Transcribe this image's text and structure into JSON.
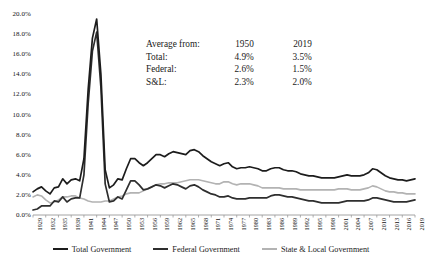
{
  "chart_data": {
    "type": "line",
    "title": "",
    "xlabel": "",
    "ylabel": "",
    "ylim": [
      0,
      20
    ],
    "ytick_labels": [
      "20.0%",
      "18.0%",
      "16.0%",
      "14.0%",
      "12.0%",
      "10.0%",
      "8.0%",
      "6.0%",
      "4.0%",
      "2.0%",
      "0.0%"
    ],
    "ytick_values": [
      20,
      18,
      16,
      14,
      12,
      10,
      8,
      6,
      4,
      2,
      0
    ],
    "grid": false,
    "legend_position": "bottom",
    "xlim": [
      1929,
      2019
    ],
    "xtick_labels": [
      "1929",
      "1932",
      "1935",
      "1938",
      "1941",
      "1944",
      "1947",
      "1950",
      "1953",
      "1956",
      "1959",
      "1962",
      "1965",
      "1968",
      "1971",
      "1974",
      "1977",
      "1980",
      "1983",
      "1986",
      "1989",
      "1992",
      "1995",
      "1998",
      "2001",
      "2004",
      "2007",
      "2010",
      "2013",
      "2016",
      "2019"
    ],
    "x": [
      1929,
      1930,
      1931,
      1932,
      1933,
      1934,
      1935,
      1936,
      1937,
      1938,
      1939,
      1940,
      1941,
      1942,
      1943,
      1944,
      1945,
      1946,
      1947,
      1948,
      1949,
      1950,
      1951,
      1952,
      1953,
      1954,
      1955,
      1956,
      1957,
      1958,
      1959,
      1960,
      1961,
      1962,
      1963,
      1964,
      1965,
      1966,
      1967,
      1968,
      1969,
      1970,
      1971,
      1972,
      1973,
      1974,
      1975,
      1976,
      1977,
      1978,
      1979,
      1980,
      1981,
      1982,
      1983,
      1984,
      1985,
      1986,
      1987,
      1988,
      1989,
      1990,
      1991,
      1992,
      1993,
      1994,
      1995,
      1996,
      1997,
      1998,
      1999,
      2000,
      2001,
      2002,
      2003,
      2004,
      2005,
      2006,
      2007,
      2008,
      2009,
      2010,
      2011,
      2012,
      2013,
      2014,
      2015,
      2016,
      2017,
      2018,
      2019
    ],
    "series": [
      {
        "name": "Total Government",
        "color": "#1c1c1c",
        "values": [
          2.3,
          2.6,
          2.8,
          2.4,
          2.1,
          2.7,
          2.8,
          3.6,
          3.1,
          3.5,
          3.6,
          3.4,
          5.6,
          12.5,
          17.6,
          19.5,
          14.0,
          4.5,
          2.7,
          3.0,
          3.6,
          3.5,
          4.6,
          5.6,
          5.6,
          5.2,
          4.9,
          5.2,
          5.6,
          6.0,
          6.0,
          5.8,
          6.1,
          6.3,
          6.2,
          6.1,
          6.0,
          6.4,
          6.5,
          6.3,
          5.9,
          5.6,
          5.3,
          5.1,
          4.9,
          5.1,
          5.2,
          4.8,
          4.6,
          4.7,
          4.7,
          4.8,
          4.7,
          4.6,
          4.4,
          4.4,
          4.6,
          4.7,
          4.7,
          4.5,
          4.4,
          4.4,
          4.3,
          4.1,
          4.0,
          3.9,
          3.9,
          3.8,
          3.7,
          3.7,
          3.7,
          3.7,
          3.8,
          3.9,
          4.0,
          3.9,
          3.9,
          3.9,
          4.0,
          4.2,
          4.6,
          4.5,
          4.2,
          3.9,
          3.7,
          3.6,
          3.5,
          3.5,
          3.4,
          3.5,
          3.6
        ]
      },
      {
        "name": "Federal Government",
        "color": "#2e2e2e",
        "values": [
          0.5,
          0.6,
          0.9,
          0.9,
          0.9,
          1.4,
          1.3,
          1.8,
          1.3,
          1.6,
          1.7,
          1.7,
          4.0,
          11.1,
          16.3,
          18.2,
          12.7,
          3.1,
          1.3,
          1.4,
          1.8,
          1.6,
          2.5,
          3.4,
          3.4,
          3.0,
          2.5,
          2.6,
          2.8,
          3.0,
          2.9,
          2.7,
          2.9,
          3.1,
          3.0,
          2.8,
          2.6,
          2.9,
          3.0,
          2.8,
          2.5,
          2.3,
          2.1,
          2.0,
          1.8,
          1.8,
          1.9,
          1.7,
          1.6,
          1.6,
          1.6,
          1.7,
          1.7,
          1.7,
          1.7,
          1.7,
          1.9,
          2.0,
          2.0,
          1.9,
          1.8,
          1.8,
          1.7,
          1.6,
          1.5,
          1.4,
          1.4,
          1.3,
          1.2,
          1.2,
          1.2,
          1.2,
          1.2,
          1.3,
          1.4,
          1.4,
          1.4,
          1.4,
          1.4,
          1.5,
          1.7,
          1.7,
          1.6,
          1.5,
          1.4,
          1.3,
          1.3,
          1.3,
          1.3,
          1.4,
          1.5
        ]
      },
      {
        "name": "State & Local Government",
        "color": "#b3b3b3",
        "values": [
          1.8,
          2.0,
          1.9,
          1.5,
          1.2,
          1.3,
          1.5,
          1.8,
          1.8,
          1.9,
          1.9,
          1.7,
          1.6,
          1.4,
          1.3,
          1.3,
          1.3,
          1.4,
          1.4,
          1.6,
          1.8,
          1.9,
          2.1,
          2.2,
          2.2,
          2.2,
          2.4,
          2.6,
          2.8,
          3.0,
          3.1,
          3.1,
          3.2,
          3.2,
          3.2,
          3.3,
          3.4,
          3.5,
          3.5,
          3.5,
          3.4,
          3.3,
          3.2,
          3.1,
          3.1,
          3.3,
          3.3,
          3.1,
          3.0,
          3.1,
          3.1,
          3.1,
          3.0,
          2.9,
          2.7,
          2.7,
          2.7,
          2.7,
          2.7,
          2.6,
          2.6,
          2.6,
          2.6,
          2.5,
          2.5,
          2.5,
          2.5,
          2.5,
          2.5,
          2.5,
          2.5,
          2.5,
          2.6,
          2.6,
          2.6,
          2.5,
          2.5,
          2.5,
          2.6,
          2.7,
          2.9,
          2.8,
          2.6,
          2.4,
          2.3,
          2.3,
          2.2,
          2.2,
          2.1,
          2.1,
          2.1
        ]
      }
    ]
  },
  "annotation": {
    "rows": [
      {
        "label": "Average from:",
        "col1": "1950",
        "col2": "2019"
      },
      {
        "label": "Total:",
        "col1": "4.9%",
        "col2": "3.5%"
      },
      {
        "label": "Federal:",
        "col1": "2.6%",
        "col2": "1.5%"
      },
      {
        "label": "S&L:",
        "col1": "2.3%",
        "col2": "2.0%"
      }
    ]
  },
  "legend": {
    "items": [
      {
        "label": "Total Government",
        "color": "#1c1c1c"
      },
      {
        "label": "Federal Government",
        "color": "#2e2e2e"
      },
      {
        "label": "State & Local Government",
        "color": "#b3b3b3"
      }
    ]
  },
  "axis": {
    "color": "#9a9a9a"
  }
}
